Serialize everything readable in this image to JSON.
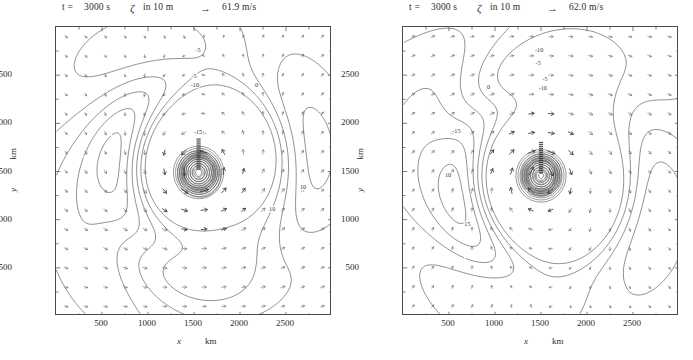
{
  "figure": {
    "width": 693,
    "height": 360,
    "panel_count": 2
  },
  "panels": [
    {
      "id": "left",
      "header": {
        "time_label": "t =",
        "time_value": "3000 s",
        "field_symbol": "ζ",
        "field_units": "in 10 m",
        "arrow_glyph": "→",
        "reference_speed": "61.9 m/s"
      },
      "axes": {
        "x_label": "x",
        "x_unit": "km",
        "y_label": "y",
        "y_unit": "km",
        "x_ticks": [
          500,
          1000,
          1500,
          2000,
          2500
        ],
        "y_ticks": [
          500,
          1000,
          1500,
          2000,
          2500
        ],
        "x_range": [
          0,
          3000
        ],
        "y_range": [
          0,
          3000
        ],
        "x_minor_step": 250,
        "y_minor_step": 250
      },
      "vortex": {
        "center_x": 1550,
        "center_y": 1490,
        "core_radius": 55
      },
      "contour_labels": [
        {
          "text": "-5",
          "x": 1545,
          "y": 2740
        },
        {
          "text": "-5",
          "x": 1500,
          "y": 2470
        },
        {
          "text": "-10",
          "x": 1510,
          "y": 2380
        },
        {
          "text": "0",
          "x": 2180,
          "y": 2375
        },
        {
          "text": "-15",
          "x": 1545,
          "y": 1890
        },
        {
          "text": "10",
          "x": 2685,
          "y": 1320
        },
        {
          "text": "10",
          "x": 2350,
          "y": 1090
        }
      ]
    },
    {
      "id": "right",
      "header": {
        "time_label": "t =",
        "time_value": "3000 s",
        "field_symbol": "ζ",
        "field_units": "in 10 m",
        "arrow_glyph": "→",
        "reference_speed": "62.0 m/s"
      },
      "axes": {
        "x_label": "x",
        "x_unit": "km",
        "y_label": "y",
        "y_unit": "km",
        "x_ticks": [
          500,
          1000,
          1500,
          2000,
          2500
        ],
        "y_ticks": [
          500,
          1000,
          1500,
          2000,
          2500
        ],
        "x_range": [
          0,
          3000
        ],
        "y_range": [
          0,
          3000
        ],
        "x_minor_step": 250,
        "y_minor_step": 250
      },
      "vortex": {
        "center_x": 1500,
        "center_y": 1455,
        "core_radius": 55
      },
      "contour_labels": [
        {
          "text": "-10",
          "x": 1480,
          "y": 2740
        },
        {
          "text": "-5",
          "x": 1470,
          "y": 2610
        },
        {
          "text": "-5",
          "x": 1545,
          "y": 2440
        },
        {
          "text": "-10",
          "x": 1520,
          "y": 2345
        },
        {
          "text": "0",
          "x": 930,
          "y": 2360
        },
        {
          "text": "-15",
          "x": 580,
          "y": 1900
        },
        {
          "text": "10",
          "x": 490,
          "y": 1440
        },
        {
          "text": "15",
          "x": 700,
          "y": 930
        }
      ]
    }
  ],
  "chart_data": {
    "type": "contour-quiver",
    "xlabel": "x (km)",
    "ylabel": "y (km)",
    "xlim": [
      0,
      3000
    ],
    "ylim": [
      0,
      3000
    ],
    "grid": false,
    "legend": "reference vector arrow with magnitude annotation in header",
    "contour_levels": [
      -15,
      -10,
      -5,
      0,
      5,
      10,
      15
    ],
    "contour_unit": "10^-4 s^-1",
    "vector_field": "10 m horizontal wind",
    "quiver_grid": {
      "nx": 14,
      "ny": 15
    },
    "panels": [
      {
        "name": "left",
        "reference_vector_speed": 61.9,
        "reference_vector_unit": "m/s",
        "vortex_center": [
          1550,
          1490
        ],
        "labeled_contours": [
          -5,
          -10,
          0,
          -15,
          10
        ]
      },
      {
        "name": "right",
        "reference_vector_speed": 62.0,
        "reference_vector_unit": "m/s",
        "vortex_center": [
          1500,
          1455
        ],
        "labeled_contours": [
          -10,
          -5,
          0,
          -15,
          10,
          15
        ]
      }
    ]
  }
}
